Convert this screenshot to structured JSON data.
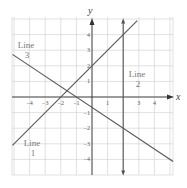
{
  "chart_data": {
    "type": "line",
    "title": "",
    "xlabel": "x",
    "ylabel": "y",
    "xlim": [
      -5.2,
      5.2
    ],
    "ylim": [
      -5,
      5
    ],
    "grid": true,
    "x_ticks": [
      -4,
      -3,
      -2,
      -1,
      1,
      3,
      4
    ],
    "y_ticks": [
      4,
      3,
      2,
      1,
      -1,
      -2,
      -3,
      -4
    ],
    "series": [
      {
        "name": "Line 1",
        "equation": "y = x + 2",
        "points": [
          [
            -5.1,
            -3.1
          ],
          [
            2.9,
            4.9
          ]
        ],
        "label_pos": [
          -4.4,
          -3.5
        ]
      },
      {
        "name": "Line 2",
        "equation": "x = 2",
        "points": [
          [
            2,
            -4.9
          ],
          [
            2,
            4.9
          ]
        ],
        "label_pos": [
          2.8,
          1.0
        ]
      },
      {
        "name": "Line 3",
        "equation": "y = -2/3 x - 2/3",
        "points": [
          [
            -5.1,
            2.73
          ],
          [
            5.2,
            -4.13
          ]
        ],
        "label_pos": [
          -4.5,
          3.3
        ]
      }
    ],
    "labels": {
      "line1": [
        "Line",
        "1"
      ],
      "line2": [
        "Line",
        "2"
      ],
      "line3": [
        "Line",
        "3"
      ]
    }
  },
  "colors": {
    "line": "#555555",
    "grid": "#d4d4d4",
    "axis": "#333333",
    "text": "#777777"
  }
}
